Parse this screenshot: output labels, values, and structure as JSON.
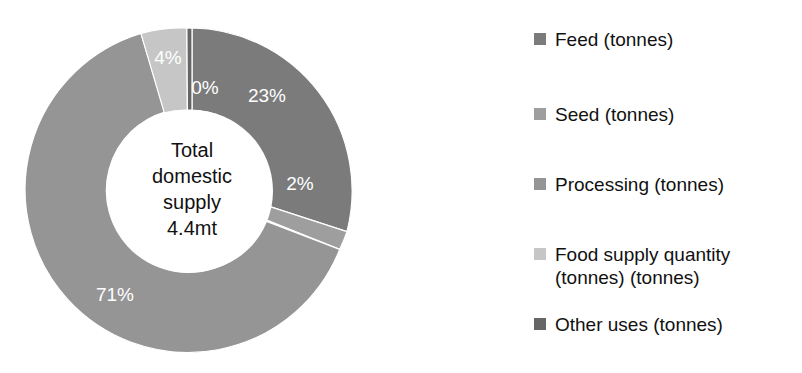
{
  "chart_data": {
    "type": "pie",
    "variant": "donut",
    "title": "",
    "subtitle": "",
    "center_text": "Total\ndomestic\nsupply\n4.4mt",
    "center_lines": [
      "Total",
      "domestic",
      "supply",
      "4.4mt"
    ],
    "categories": [
      "Feed (tonnes)",
      "Seed (tonnes)",
      "Processing (tonnes)",
      "Food supply quantity (tonnes) (tonnes)",
      "Other uses (tonnes)"
    ],
    "values": [
      23,
      2,
      71,
      4,
      0
    ],
    "value_labels": [
      "23%",
      "2%",
      "71%",
      "4%",
      "0%"
    ],
    "units": "percent",
    "total_label": "4.4mt",
    "colors": [
      "#7b7b7b",
      "#9e9e9e",
      "#959595",
      "#c6c6c6",
      "#666666"
    ],
    "legend_position": "right",
    "grid": false,
    "xlabel": "",
    "ylabel": ""
  },
  "legend": {
    "items": [
      {
        "label": "Feed (tonnes)",
        "color": "#7b7b7b",
        "swatch": "legend-swatch-feed"
      },
      {
        "label": "Seed (tonnes)",
        "color": "#9e9e9e",
        "swatch": "legend-swatch-seed"
      },
      {
        "label": "Processing (tonnes)",
        "color": "#959595",
        "swatch": "legend-swatch-processing"
      },
      {
        "label": "Food supply quantity\n(tonnes) (tonnes)",
        "color": "#c6c6c6",
        "swatch": "legend-swatch-food-supply"
      },
      {
        "label": "Other uses (tonnes)",
        "color": "#666666",
        "swatch": "legend-swatch-other-uses"
      }
    ]
  },
  "center": {
    "line1": "Total",
    "line2": "domestic",
    "line3": "supply",
    "line4": "4.4mt"
  },
  "slice_labels": {
    "feed": "23%",
    "seed": "2%",
    "processing": "71%",
    "food_supply": "4%",
    "other_uses": "0%"
  }
}
